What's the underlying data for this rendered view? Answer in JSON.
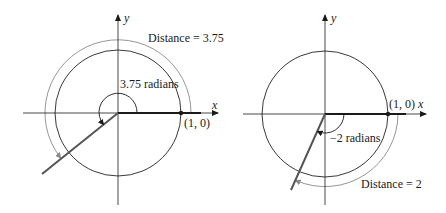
{
  "figures": [
    {
      "id": "left",
      "axis_x_label": "x",
      "axis_y_label": "y",
      "angle_label": "3.75 radians",
      "distance_label": "Distance = 3.75",
      "point_label": "(1, 0)",
      "angle_radians": 3.75,
      "direction": "counterclockwise"
    },
    {
      "id": "right",
      "axis_x_label": "x",
      "axis_y_label": "y",
      "angle_label": "−2 radians",
      "distance_label": "Distance = 2",
      "point_label": "(1, 0)",
      "angle_radians": -2,
      "direction": "clockwise"
    }
  ],
  "colors": {
    "axis": "#1a1a1a",
    "circle": "#222222",
    "terminal_side": "#555555",
    "distance_arc": "#8a8a8a"
  }
}
